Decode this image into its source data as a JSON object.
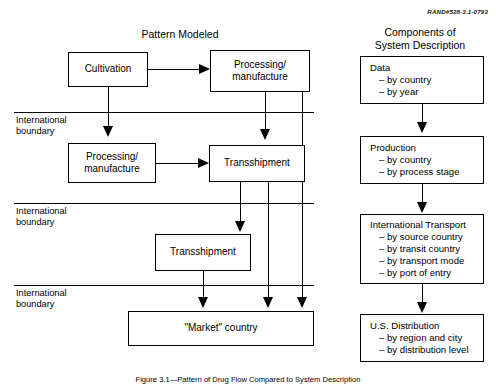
{
  "figure": {
    "rand_id": "RAND#528-3.1-0793",
    "caption": "Figure 3.1—Pattern of Drug Flow Compared to System Description"
  },
  "left_panel": {
    "title": "Pattern Modeled",
    "boundary_label": "International\nboundary",
    "boundaries": [
      {
        "label": "International\nboundary"
      },
      {
        "label": "International\nboundary"
      },
      {
        "label": "International\nboundary"
      }
    ],
    "nodes": [
      {
        "id": "cultivation",
        "label": "Cultivation"
      },
      {
        "id": "processing-top",
        "label": "Processing/\nmanufacture"
      },
      {
        "id": "processing-second",
        "label": "Processing/\nmanufacture"
      },
      {
        "id": "transshipment-second",
        "label": "Transshipment"
      },
      {
        "id": "transshipment-third",
        "label": "Transshipment"
      },
      {
        "id": "market-country",
        "label": "\"Market\" country"
      }
    ]
  },
  "right_panel": {
    "title": "Components of\nSystem Description",
    "boxes": [
      {
        "id": "data",
        "title": "Data",
        "items": [
          "– by country",
          "– by year"
        ]
      },
      {
        "id": "production",
        "title": "Production",
        "items": [
          "– by country",
          "– by process stage"
        ]
      },
      {
        "id": "international-transport",
        "title": "International Transport",
        "items": [
          "– by source country",
          "– by transit country",
          "– by transport mode",
          "– by port of entry"
        ]
      },
      {
        "id": "us-distribution",
        "title": "U.S. Distribution",
        "items": [
          "– by region and city",
          "– by distribution level"
        ]
      }
    ]
  },
  "colors": {
    "stroke": "#000000",
    "background": "#ffffff"
  }
}
